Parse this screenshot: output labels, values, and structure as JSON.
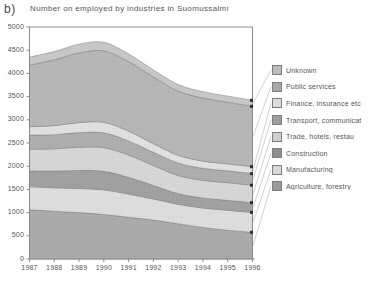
{
  "panel": {
    "label": "b)"
  },
  "chart_data": {
    "type": "area",
    "stacked": true,
    "title": "Number on employed by industries in Suomussalmi",
    "xlabel": "",
    "ylabel": "",
    "x": [
      1987,
      1988,
      1989,
      1990,
      1991,
      1992,
      1993,
      1994,
      1995,
      1996
    ],
    "categories": [
      "1987",
      "1988",
      "1989",
      "1990",
      "1991",
      "1992",
      "1993",
      "1994",
      "1995",
      "1996"
    ],
    "xlim": [
      1987,
      1996
    ],
    "ylim": [
      0,
      5000
    ],
    "yticks": [
      0,
      500,
      1000,
      1500,
      2000,
      2500,
      3000,
      3500,
      4000,
      4500,
      5000
    ],
    "ytick_labels": [
      "0",
      "500",
      "1000",
      "1500",
      "2000",
      "2500",
      "3000",
      "3500",
      "4000",
      "4500",
      "5000"
    ],
    "grid": false,
    "legend_position": "right",
    "stack_order_bottom_to_top": [
      "Agriculture, forestry",
      "Manufacturing",
      "Construction",
      "Trade, hotels, restau",
      "Transport, communicat",
      "Finance, insurance etc",
      "Public services",
      "Unknown"
    ],
    "series": [
      {
        "name": "Agriculture, forestry",
        "color": "#9a9a9a",
        "values": [
          1060,
          1030,
          1000,
          960,
          900,
          840,
          760,
          680,
          620,
          575
        ]
      },
      {
        "name": "Manufacturing",
        "color": "#d8d8d8",
        "values": [
          500,
          505,
          520,
          530,
          500,
          455,
          420,
          420,
          430,
          430
        ]
      },
      {
        "name": "Construction",
        "color": "#8e8e8e",
        "values": [
          340,
          360,
          390,
          400,
          360,
          290,
          230,
          215,
          215,
          210
        ]
      },
      {
        "name": "Trade, hotels, restau",
        "color": "#cfcfcf",
        "values": [
          470,
          480,
          500,
          510,
          480,
          430,
          390,
          380,
          380,
          375
        ]
      },
      {
        "name": "Transport, communicat",
        "color": "#9e9e9e",
        "values": [
          300,
          305,
          315,
          320,
          305,
          285,
          270,
          260,
          255,
          250
        ]
      },
      {
        "name": "Finance, insurance etc",
        "color": "#dcdcdc",
        "values": [
          180,
          195,
          215,
          225,
          210,
          185,
          165,
          155,
          150,
          150
        ]
      },
      {
        "name": "Public services",
        "color": "#a8a8a8",
        "values": [
          1330,
          1420,
          1500,
          1540,
          1500,
          1440,
          1385,
          1360,
          1330,
          1300
        ]
      },
      {
        "name": "Unknown",
        "color": "#bdbdbd",
        "values": [
          170,
          175,
          190,
          185,
          165,
          150,
          140,
          135,
          130,
          130
        ]
      }
    ],
    "totals": [
      4350,
      4470,
      4630,
      4670,
      4420,
      4075,
      3760,
      3605,
      3510,
      3420
    ]
  },
  "legend": {
    "items": [
      {
        "label": "Unknown"
      },
      {
        "label": "Public services"
      },
      {
        "label": "Finance, insurance etc"
      },
      {
        "label": "Transport, communicat"
      },
      {
        "label": "Trade, hotels, restau"
      },
      {
        "label": "Construction"
      },
      {
        "label": "Manufacturing"
      },
      {
        "label": "Agriculture, forestry"
      }
    ]
  }
}
